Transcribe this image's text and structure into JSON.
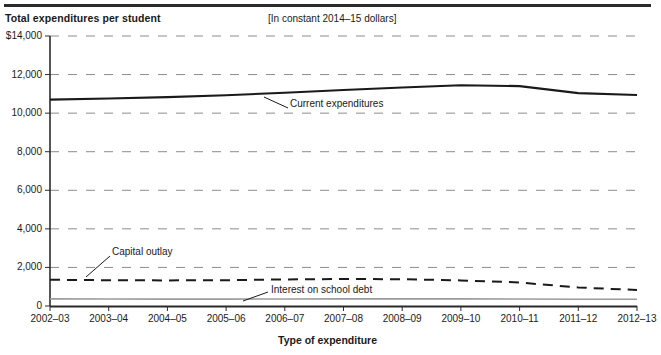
{
  "figure": {
    "title": "Total expenditures per student",
    "subtitle": "[In constant 2014–15 dollars]",
    "x_axis_title": "Type of expenditure"
  },
  "chart_data": {
    "type": "line",
    "title": "Total expenditures per student",
    "subtitle": "[In constant 2014–15 dollars]",
    "xlabel": "Type of expenditure",
    "ylabel": "",
    "ylim": [
      0,
      14000
    ],
    "ytick_labels": [
      "$14,000",
      "12,000",
      "10,000",
      "8,000",
      "6,000",
      "4,000",
      "2,000",
      "0"
    ],
    "ytick_values": [
      14000,
      12000,
      10000,
      8000,
      6000,
      4000,
      2000,
      0
    ],
    "grid": "horizontal-dashed",
    "legend": "inline-annotations",
    "categories": [
      "2002–03",
      "2003–04",
      "2004–05",
      "2005–06",
      "2006–07",
      "2007–08",
      "2008–09",
      "2009–10",
      "2010–11",
      "2011–12",
      "2012–13"
    ],
    "series": [
      {
        "name": "Current expenditures",
        "style": "solid",
        "color": "#1a1a1a",
        "values": [
          10700,
          10760,
          10830,
          10930,
          11060,
          11200,
          11330,
          11450,
          11400,
          11040,
          10940
        ]
      },
      {
        "name": "Capital outlay",
        "style": "dashed",
        "color": "#1a1a1a",
        "values": [
          1360,
          1340,
          1330,
          1340,
          1380,
          1400,
          1390,
          1330,
          1220,
          960,
          830
        ]
      },
      {
        "name": "Interest on school debt",
        "style": "solid-thin-gray",
        "color": "#9b9b9b",
        "values": [
          370,
          365,
          360,
          360,
          365,
          370,
          370,
          370,
          365,
          355,
          350
        ]
      }
    ],
    "annotations": [
      {
        "text": "Current expenditures",
        "x": 290,
        "y": 104
      },
      {
        "text": "Capital outlay",
        "x": 112,
        "y": 252
      },
      {
        "text": "Interest on school debt",
        "x": 271,
        "y": 290
      }
    ]
  }
}
